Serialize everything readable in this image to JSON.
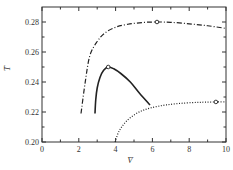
{
  "chart_data": {
    "type": "line",
    "title": "",
    "xlabel": "V̄",
    "ylabel": "T̄",
    "xlim": [
      0,
      10
    ],
    "ylim": [
      0.2,
      0.29
    ],
    "grid": false,
    "legend": "none",
    "x_ticks": [
      0,
      2,
      4,
      6,
      8,
      10
    ],
    "x_tick_labels": [
      "0",
      "2",
      "4",
      "6",
      "8",
      "10"
    ],
    "x_minor_ticks": [
      1,
      3,
      5,
      7,
      9
    ],
    "y_ticks": [
      0.2,
      0.22,
      0.24,
      0.26,
      0.28
    ],
    "y_tick_labels": [
      "0.20",
      "0.22",
      "0.24",
      "0.26",
      "0.28"
    ],
    "y_minor_ticks": [
      0.21,
      0.23,
      0.25,
      0.27
    ],
    "series": [
      {
        "name": "dash-dot",
        "style": "dashdot",
        "points": [
          [
            2.12,
            0.219
          ],
          [
            2.35,
            0.24
          ],
          [
            2.6,
            0.2575
          ],
          [
            3.0,
            0.267
          ],
          [
            3.42,
            0.2727
          ],
          [
            4.0,
            0.2765
          ],
          [
            4.67,
            0.2785
          ],
          [
            5.5,
            0.2797
          ],
          [
            6.25,
            0.28
          ],
          [
            7.0,
            0.2798
          ],
          [
            8.0,
            0.2788
          ],
          [
            9.0,
            0.2775
          ],
          [
            9.95,
            0.2758
          ]
        ],
        "marker": [
          6.25,
          0.28
        ]
      },
      {
        "name": "solid",
        "style": "solid",
        "points": [
          [
            2.88,
            0.219
          ],
          [
            2.92,
            0.228
          ],
          [
            3.0,
            0.236
          ],
          [
            3.15,
            0.243
          ],
          [
            3.35,
            0.2478
          ],
          [
            3.6,
            0.25
          ],
          [
            3.9,
            0.2488
          ],
          [
            4.3,
            0.2455
          ],
          [
            4.8,
            0.24
          ],
          [
            5.3,
            0.2325
          ],
          [
            5.87,
            0.2247
          ]
        ],
        "marker": [
          3.6,
          0.25
        ]
      },
      {
        "name": "dotted",
        "style": "dotted",
        "points": [
          [
            3.97,
            0.2
          ],
          [
            4.2,
            0.2075
          ],
          [
            4.6,
            0.214
          ],
          [
            5.2,
            0.2195
          ],
          [
            5.9,
            0.2227
          ],
          [
            6.8,
            0.2248
          ],
          [
            7.8,
            0.226
          ],
          [
            8.7,
            0.2265
          ],
          [
            9.45,
            0.2267
          ],
          [
            9.95,
            0.2267
          ]
        ],
        "marker": [
          9.45,
          0.2267
        ]
      }
    ]
  }
}
